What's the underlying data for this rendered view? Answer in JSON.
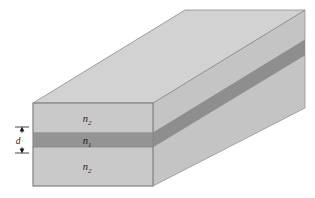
{
  "figure": {
    "type": "3d-slab-waveguide-diagram",
    "background_color": "#ffffff"
  },
  "colors": {
    "top_face": "#d2d2d2",
    "front_face": "#c9c9c9",
    "side_face": "#c4c4c4",
    "core_front": "#949494",
    "core_side": "#8e8e8e",
    "core_top_sliver": "#a0a0a0",
    "outline": "#8a8a8a",
    "label_color": "#1a1a1a"
  },
  "labels": {
    "cladding_top": {
      "base": "n",
      "sub": "2"
    },
    "core": {
      "base": "n",
      "sub": "1"
    },
    "cladding_bottom": {
      "base": "n",
      "sub": "2"
    },
    "thickness": {
      "base": "d"
    }
  },
  "geometry": {
    "front_face": {
      "left_x": 33,
      "right_x": 153,
      "top_y": 103,
      "bottom_y": 186
    },
    "core_band": {
      "top_y": 133,
      "bottom_y": 147
    },
    "depth_offset": {
      "dx": 152,
      "dy": -93
    },
    "dimension_line_x": 22
  }
}
